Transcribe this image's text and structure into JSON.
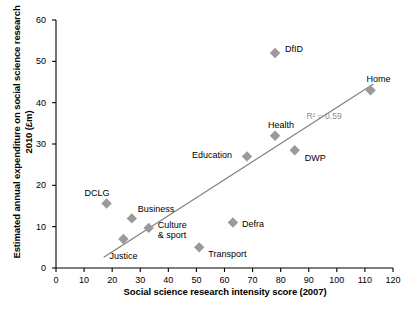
{
  "chart_data": {
    "type": "scatter",
    "title": "",
    "xlabel": "Social science research intensity score (2007)",
    "ylabel": "Estimated annual expenditure on social science research 2010 (£m)",
    "xlim": [
      0,
      120
    ],
    "ylim": [
      0,
      60
    ],
    "xticks": [
      0,
      10,
      20,
      30,
      40,
      50,
      60,
      70,
      80,
      90,
      100,
      110,
      120
    ],
    "yticks": [
      0,
      10,
      20,
      30,
      40,
      50,
      60
    ],
    "grid": false,
    "legend": "none",
    "marker": "diamond",
    "marker_color": "#9a9a9a",
    "trendline": {
      "visible": true,
      "color": "#808080",
      "x_start": 17,
      "y_start": 2.6,
      "x_end": 113,
      "y_end": 44.5
    },
    "annotations": [
      {
        "text": "R² = 0.59",
        "x": 97,
        "y": 36.5
      }
    ],
    "points": [
      {
        "label": "DCLG",
        "x": 18,
        "y": 15.6,
        "label_dx": -22,
        "label_dy": -16
      },
      {
        "label": "Justice",
        "x": 24,
        "y": 7.0,
        "label_dx": -14,
        "label_dy": 12
      },
      {
        "label": "Business",
        "x": 27,
        "y": 12.0,
        "label_dx": 6,
        "label_dy": -14
      },
      {
        "label": "Culture\n& sport",
        "x": 33,
        "y": 9.7,
        "label_dx": 9,
        "label_dy": -8
      },
      {
        "label": "Transport",
        "x": 51,
        "y": 5.0,
        "label_dx": 9,
        "label_dy": 2
      },
      {
        "label": "Defra",
        "x": 63,
        "y": 11.0,
        "label_dx": 9,
        "label_dy": -4
      },
      {
        "label": "Education",
        "x": 68,
        "y": 27.0,
        "label_dx": -55,
        "label_dy": -6
      },
      {
        "label": "DfID",
        "x": 78,
        "y": 52.0,
        "label_dx": 10,
        "label_dy": -9
      },
      {
        "label": "Health",
        "x": 78,
        "y": 32.0,
        "label_dx": -7,
        "label_dy": -16
      },
      {
        "label": "DWP",
        "x": 85,
        "y": 28.5,
        "label_dx": 10,
        "label_dy": 3
      },
      {
        "label": "Home",
        "x": 112,
        "y": 43.0,
        "label_dx": -4,
        "label_dy": -16
      }
    ]
  },
  "axes": {
    "x_title": "Social science research intensity score (2007)",
    "y_title": "Estimated annual expenditure on social science research 2010 (£m)",
    "x_tick_labels": [
      "0",
      "10",
      "20",
      "30",
      "40",
      "50",
      "60",
      "70",
      "80",
      "90",
      "100",
      "110",
      "120"
    ],
    "y_tick_labels": [
      "0",
      "10",
      "20",
      "30",
      "40",
      "50",
      "60"
    ]
  },
  "colors": {
    "axis": "#000000",
    "marker": "#9a9a9a",
    "trendline": "#808080",
    "annotation": "#8c8c8c",
    "background": "#ffffff"
  }
}
